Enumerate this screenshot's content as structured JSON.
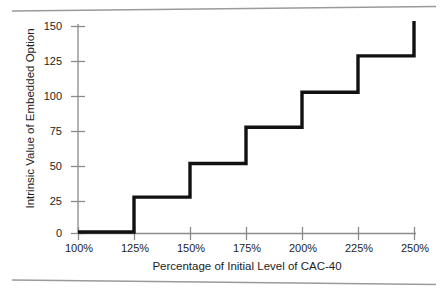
{
  "figure": {
    "background_color": "#ffffff",
    "line_color": "#111111",
    "axis_color": "#8a8a8a",
    "rule_color": "#9a9a9a"
  },
  "chart_data": {
    "type": "line",
    "subtype": "step",
    "title": "",
    "subtitle": "",
    "xlabel": "Percentage of Initial Level of CAC-40",
    "ylabel": "Intrinsic Value of Embedded Option",
    "x_tick_labels": [
      "100%",
      "125%",
      "150%",
      "175%",
      "200%",
      "225%",
      "250%"
    ],
    "x_tick_values": [
      100,
      125,
      150,
      175,
      200,
      225,
      250
    ],
    "y_tick_labels": [
      "0",
      "25",
      "50",
      "75",
      "100",
      "125",
      "150"
    ],
    "y_tick_values": [
      0,
      25,
      50,
      75,
      100,
      125,
      150
    ],
    "xlim": [
      100,
      250
    ],
    "ylim": [
      0,
      160
    ],
    "grid": false,
    "legend": null,
    "annotations": [],
    "step_segments": [
      {
        "x_start": 100,
        "x_end": 125,
        "value": 0
      },
      {
        "x_start": 125,
        "x_end": 150,
        "value": 26
      },
      {
        "x_start": 150,
        "x_end": 175,
        "value": 51
      },
      {
        "x_start": 175,
        "x_end": 200,
        "value": 78
      },
      {
        "x_start": 200,
        "x_end": 225,
        "value": 104
      },
      {
        "x_start": 225,
        "x_end": 250,
        "value": 131
      }
    ],
    "final_riser": {
      "x": 250,
      "from": 131,
      "to": 157
    },
    "x": [
      100,
      125,
      125,
      150,
      150,
      175,
      175,
      200,
      200,
      225,
      225,
      250,
      250
    ],
    "values": [
      0,
      0,
      26,
      26,
      51,
      51,
      78,
      78,
      104,
      104,
      131,
      131,
      157
    ]
  }
}
